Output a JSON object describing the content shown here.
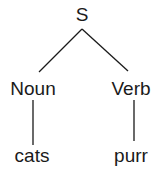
{
  "tree": {
    "root": {
      "label": "S"
    },
    "children": [
      {
        "label": "Noun",
        "leaf": "cats"
      },
      {
        "label": "Verb",
        "leaf": "purr"
      }
    ]
  },
  "colors": {
    "ink": "#1a1a1a",
    "background": "#ffffff"
  }
}
